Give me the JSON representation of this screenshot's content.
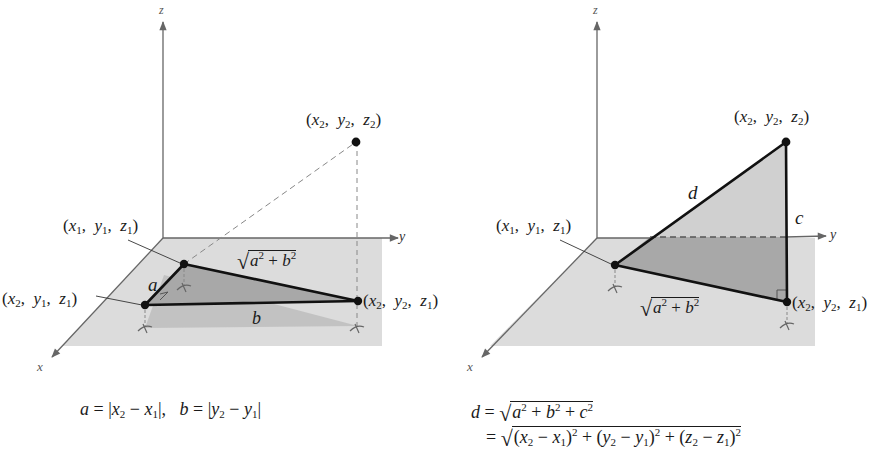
{
  "figures": [
    {
      "id": "left",
      "axes": {
        "x": "x",
        "y": "y",
        "z": "z"
      },
      "points": [
        {
          "name": "P1",
          "label": "(x1, y1, z1)",
          "parts": [
            "x",
            "1",
            "y",
            "1",
            "z",
            "1"
          ]
        },
        {
          "name": "P2",
          "label": "(x2, y1, z1)",
          "parts": [
            "x",
            "2",
            "y",
            "1",
            "z",
            "1"
          ]
        },
        {
          "name": "P3",
          "label": "(x2, y2, z1)",
          "parts": [
            "x",
            "2",
            "y",
            "2",
            "z",
            "1"
          ]
        },
        {
          "name": "P4",
          "label": "(x2, y2, z2)",
          "parts": [
            "x",
            "2",
            "y",
            "2",
            "z",
            "2"
          ]
        }
      ],
      "edge_labels": {
        "a": "a",
        "b": "b",
        "hyp": "√(a² + b²)"
      },
      "caption": "a = |x2 − x1|,  b = |y2 − y1|"
    },
    {
      "id": "right",
      "axes": {
        "x": "x",
        "y": "y",
        "z": "z"
      },
      "points": [
        {
          "name": "P1",
          "label": "(x1, y1, z1)",
          "parts": [
            "x",
            "1",
            "y",
            "1",
            "z",
            "1"
          ]
        },
        {
          "name": "P2",
          "label": "(x2, y2, z1)",
          "parts": [
            "x",
            "2",
            "y",
            "2",
            "z",
            "1"
          ]
        },
        {
          "name": "P3",
          "label": "(x2, y2, z2)",
          "parts": [
            "x",
            "2",
            "y",
            "2",
            "z",
            "2"
          ]
        }
      ],
      "edge_labels": {
        "d": "d",
        "c": "c",
        "base": "√(a² + b²)"
      },
      "caption_line1": "d = √(a² + b² + c²)",
      "caption_line2": "= √((x2 − x1)² + (y2 − y1)² + (z2 − z1)²)"
    }
  ],
  "text": {
    "x": "x",
    "y": "y",
    "z": "z",
    "a": "a",
    "b": "b",
    "c": "c",
    "d": "d",
    "sub1": "1",
    "sub2": "2",
    "sq": "2",
    "open": "(",
    "close": ")",
    "comma": ",",
    "eq": "=",
    "plus": "+",
    "minus": "−",
    "bar": "|",
    "sqrt": "√"
  },
  "colors": {
    "plane": "#dcdcdc",
    "triangle_fill": "#a9a9a9",
    "projection_fill": "#c4c4c4",
    "vertical_fill": "#d2d2d2",
    "line": "#111111",
    "axis": "#666666",
    "dashed": "#888888"
  }
}
